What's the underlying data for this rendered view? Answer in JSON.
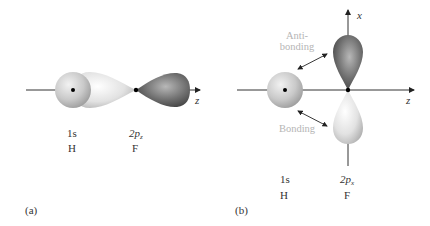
{
  "panel_a": {
    "caption": "(a)",
    "axis_label": "z",
    "h_orbital": "1s",
    "h_atom": "H",
    "f_orbital_main": "2p",
    "f_orbital_sub": "z",
    "f_atom": "F"
  },
  "panel_b": {
    "caption": "(b)",
    "axis_z_label": "z",
    "axis_x_label": "x",
    "antibonding_line1": "Anti-",
    "antibonding_line2": "bonding",
    "bonding_label": "Bonding",
    "h_orbital": "1s",
    "h_atom": "H",
    "f_orbital_main": "2p",
    "f_orbital_sub": "x",
    "f_atom": "F"
  },
  "colors": {
    "s_orbital": "#c8c8c8",
    "light_lobe": "#dedede",
    "dark_lobe": "#6a6a6a",
    "axis": "#333333",
    "annotation": "#b5b5b5"
  }
}
